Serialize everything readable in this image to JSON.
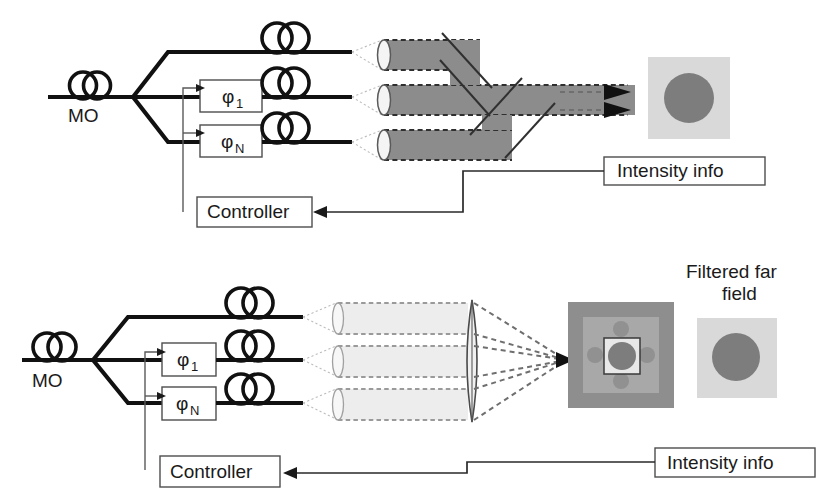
{
  "figure": {
    "background_color": "#ffffff"
  },
  "palette": {
    "ink": "#111111",
    "box_stroke": "#4d4d4d",
    "beam_dark": "#8c8c8c",
    "beam_light": "#ededed",
    "square_light": "#d9d9d9",
    "square_mid": "#a8a8a8",
    "square_dark": "#8e8e8e",
    "circle_gray": "#7d7d7d",
    "control_line": "#5a5a5a"
  },
  "top_diagram": {
    "name": "tiled-aperture-combining",
    "source_label": "MO",
    "phase_modulators": [
      {
        "symbol": "φ",
        "subscript": "1"
      },
      {
        "symbol": "φ",
        "subscript": "N"
      }
    ],
    "amplifier_count": 3,
    "controller_label": "Controller",
    "feedback_label": "Intensity info",
    "beam_count": 3,
    "output_arrow_count": 2,
    "beam_style": "solid dark gray cylinders with dashed outline",
    "combiner_elements": 3,
    "far_field": {
      "square_color": "#d9d9d9",
      "spot_color": "#7d7d7d",
      "caption": ""
    }
  },
  "bottom_diagram": {
    "name": "filled-aperture-combining",
    "source_label": "MO",
    "phase_modulators": [
      {
        "symbol": "φ",
        "subscript": "1"
      },
      {
        "symbol": "φ",
        "subscript": "N"
      }
    ],
    "amplifier_count": 3,
    "controller_label": "Controller",
    "feedback_label": "Intensity info",
    "beam_count": 3,
    "beam_style": "light gray cylinders with dashed outline",
    "lens_label": "",
    "far_field": {
      "outer_square_color": "#8e8e8e",
      "inner_square_color": "#a8a8a8",
      "aperture_square_color": "#e8e8e8",
      "main_lobe_color": "#7d7d7d",
      "side_lobe_count": 4
    },
    "filtered_far_field": {
      "caption_line1": "Filtered far",
      "caption_line2": "field",
      "square_color": "#d9d9d9",
      "spot_color": "#7d7d7d"
    }
  }
}
